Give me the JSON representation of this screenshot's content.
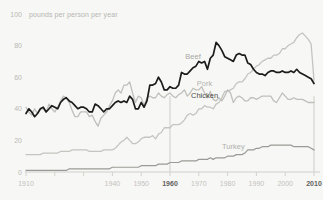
{
  "chart_data": {
    "type": "line",
    "title": "",
    "unit_label": "pounds per person per year",
    "xlabel": "",
    "ylabel": "",
    "xlim": [
      1910,
      2010
    ],
    "ylim": [
      0,
      100
    ],
    "grid": false,
    "legend_position": "inline-labels",
    "y_ticks": [
      "0",
      "20",
      "40",
      "60",
      "80",
      "100"
    ],
    "y_tick_values": [
      0,
      20,
      40,
      60,
      80,
      100
    ],
    "x_ticks": [
      "1910",
      "",
      "",
      "1940",
      "1950",
      "1960",
      "1970",
      "1980",
      "1990",
      "2000",
      "2010"
    ],
    "x_tick_values": [
      1910,
      1920,
      1930,
      1940,
      1950,
      1960,
      1970,
      1980,
      1990,
      2000,
      2010
    ],
    "x_emphasized_ticks": [
      "1960",
      "2010"
    ],
    "reference_lines": [
      1960,
      2010
    ],
    "x": [
      1910,
      1911,
      1912,
      1913,
      1914,
      1915,
      1916,
      1917,
      1918,
      1919,
      1920,
      1921,
      1922,
      1923,
      1924,
      1925,
      1926,
      1927,
      1928,
      1929,
      1930,
      1931,
      1932,
      1933,
      1934,
      1935,
      1936,
      1937,
      1938,
      1939,
      1940,
      1941,
      1942,
      1943,
      1944,
      1945,
      1946,
      1947,
      1948,
      1949,
      1950,
      1951,
      1952,
      1953,
      1954,
      1955,
      1956,
      1957,
      1958,
      1959,
      1960,
      1961,
      1962,
      1963,
      1964,
      1965,
      1966,
      1967,
      1968,
      1969,
      1970,
      1971,
      1972,
      1973,
      1974,
      1975,
      1976,
      1977,
      1978,
      1979,
      1980,
      1981,
      1982,
      1983,
      1984,
      1985,
      1986,
      1987,
      1988,
      1989,
      1990,
      1991,
      1992,
      1993,
      1994,
      1995,
      1996,
      1997,
      1998,
      1999,
      2000,
      2001,
      2002,
      2003,
      2004,
      2005,
      2006,
      2007,
      2008,
      2009,
      2010
    ],
    "series": [
      {
        "name": "Beef",
        "color": "#1c1c1c",
        "label_year": 1968,
        "values": [
          37,
          40,
          38,
          35,
          37,
          40,
          41,
          38,
          40,
          42,
          41,
          40,
          44,
          46,
          47,
          45,
          44,
          42,
          40,
          41,
          41,
          40,
          38,
          38,
          43,
          42,
          40,
          38,
          40,
          40,
          42,
          44,
          45,
          44,
          45,
          44,
          48,
          46,
          40,
          40,
          44,
          41,
          45,
          55,
          55,
          56,
          60,
          57,
          52,
          52,
          54,
          53,
          53,
          55,
          63,
          62,
          62,
          64,
          66,
          67,
          70,
          69,
          70,
          65,
          72,
          74,
          82,
          80,
          77,
          73,
          72,
          71,
          70,
          74,
          75,
          74,
          74,
          69,
          68,
          65,
          63,
          62,
          62,
          61,
          63,
          64,
          64,
          63,
          63,
          64,
          63,
          63,
          64,
          63,
          65,
          63,
          62,
          61,
          60,
          59,
          56
        ],
        "start_value": 37,
        "peak": {
          "year": 1976,
          "value": 82
        },
        "end_value": 56
      },
      {
        "name": "Pork",
        "color": "#bfbfbb",
        "label_year": 1972,
        "values": [
          41,
          38,
          36,
          40,
          37,
          40,
          40,
          38,
          43,
          40,
          38,
          41,
          45,
          48,
          47,
          44,
          39,
          35,
          35,
          38,
          38,
          38,
          35,
          36,
          32,
          29,
          34,
          36,
          38,
          42,
          45,
          50,
          52,
          50,
          55,
          55,
          57,
          50,
          44,
          48,
          47,
          42,
          47,
          48,
          47,
          47,
          50,
          48,
          47,
          49,
          50,
          48,
          47,
          49,
          50,
          52,
          48,
          50,
          53,
          52,
          52,
          54,
          50,
          47,
          51,
          46,
          45,
          47,
          45,
          48,
          52,
          50,
          44,
          47,
          48,
          47,
          45,
          45,
          47,
          47,
          46,
          47,
          48,
          48,
          48,
          48,
          45,
          44,
          47,
          50,
          48,
          46,
          46,
          47,
          46,
          46,
          46,
          45,
          44,
          44,
          44
        ],
        "start_value": 41,
        "end_value": 44
      },
      {
        "name": "Chicken",
        "color": "#c4c4c0",
        "label_year": 1972,
        "values": [
          11,
          11,
          11,
          11,
          11,
          11,
          12,
          12,
          12,
          12,
          12,
          12,
          13,
          13,
          13,
          13,
          14,
          14,
          14,
          14,
          14,
          14,
          13,
          13,
          13,
          13,
          13,
          14,
          14,
          14,
          14,
          15,
          17,
          19,
          20,
          22,
          20,
          18,
          18,
          19,
          21,
          22,
          22,
          22,
          23,
          21,
          24,
          25,
          28,
          28,
          28,
          30,
          30,
          30,
          31,
          33,
          36,
          37,
          36,
          37,
          40,
          40,
          42,
          41,
          41,
          40,
          43,
          44,
          47,
          51,
          51,
          52,
          53,
          56,
          57,
          57,
          59,
          62,
          63,
          65,
          67,
          68,
          70,
          71,
          72,
          72,
          74,
          74,
          75,
          78,
          78,
          80,
          81,
          82,
          85,
          87,
          88,
          86,
          84,
          81,
          58
        ],
        "start_value": 11,
        "end_value": 58
      },
      {
        "name": "Turkey",
        "color": "#9a9a96",
        "label_year": 1982,
        "values": [
          1,
          1,
          1,
          1,
          1,
          1,
          1,
          1,
          1,
          1,
          1,
          1,
          1,
          1,
          1,
          2,
          2,
          2,
          2,
          2,
          2,
          2,
          2,
          2,
          2,
          2,
          2,
          2,
          2,
          2,
          3,
          3,
          3,
          3,
          3,
          3,
          3,
          3,
          3,
          3,
          4,
          4,
          4,
          4,
          4,
          4,
          5,
          5,
          5,
          5,
          6,
          6,
          6,
          6,
          7,
          7,
          7,
          7,
          7,
          7,
          8,
          8,
          8,
          8,
          9,
          8,
          9,
          9,
          9,
          9,
          10,
          10,
          10,
          11,
          11,
          11,
          12,
          14,
          14,
          14,
          15,
          15,
          16,
          16,
          16,
          17,
          17,
          17,
          17,
          17,
          17,
          17,
          17,
          16,
          16,
          16,
          16,
          16,
          16,
          15,
          14
        ],
        "start_value": 1,
        "end_value": 14
      }
    ]
  }
}
